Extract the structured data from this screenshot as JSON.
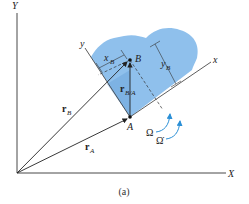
{
  "figure": {
    "caption": "(a)",
    "colors": {
      "body_fill": "#8fc0ec",
      "body_dark": "#6fa6dc",
      "line": "#333333",
      "omega_arrow": "#2b8fd6"
    },
    "axes": {
      "global_x_label": "X",
      "global_y_label": "Y",
      "local_x_label": "x",
      "local_y_label": "y"
    },
    "points": {
      "A_label": "A",
      "B_label": "B"
    },
    "vectors": {
      "rA": {
        "main": "r",
        "sub": "A"
      },
      "rB": {
        "main": "r",
        "sub": "B"
      },
      "rBA": {
        "main": "r",
        "sub": "B/A"
      }
    },
    "dimensions": {
      "xB": {
        "main": "x",
        "sub": "B"
      },
      "yB": {
        "main": "y",
        "sub": "B"
      }
    },
    "rotation": {
      "omega_label": "Ω",
      "omega_dot_label": "Ω̇"
    }
  }
}
